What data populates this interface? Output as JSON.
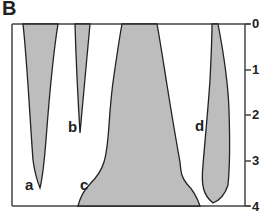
{
  "panel": {
    "label": "B"
  },
  "axis": {
    "orientation": "vertical-right",
    "ticks": [
      "0",
      "1",
      "2",
      "3",
      "4"
    ]
  },
  "shapes": [
    {
      "label": "a"
    },
    {
      "label": "b"
    },
    {
      "label": "c"
    },
    {
      "label": "d"
    }
  ],
  "colors": {
    "fill": "#bdbdbd",
    "stroke": "#222222",
    "frame": "#444444"
  }
}
